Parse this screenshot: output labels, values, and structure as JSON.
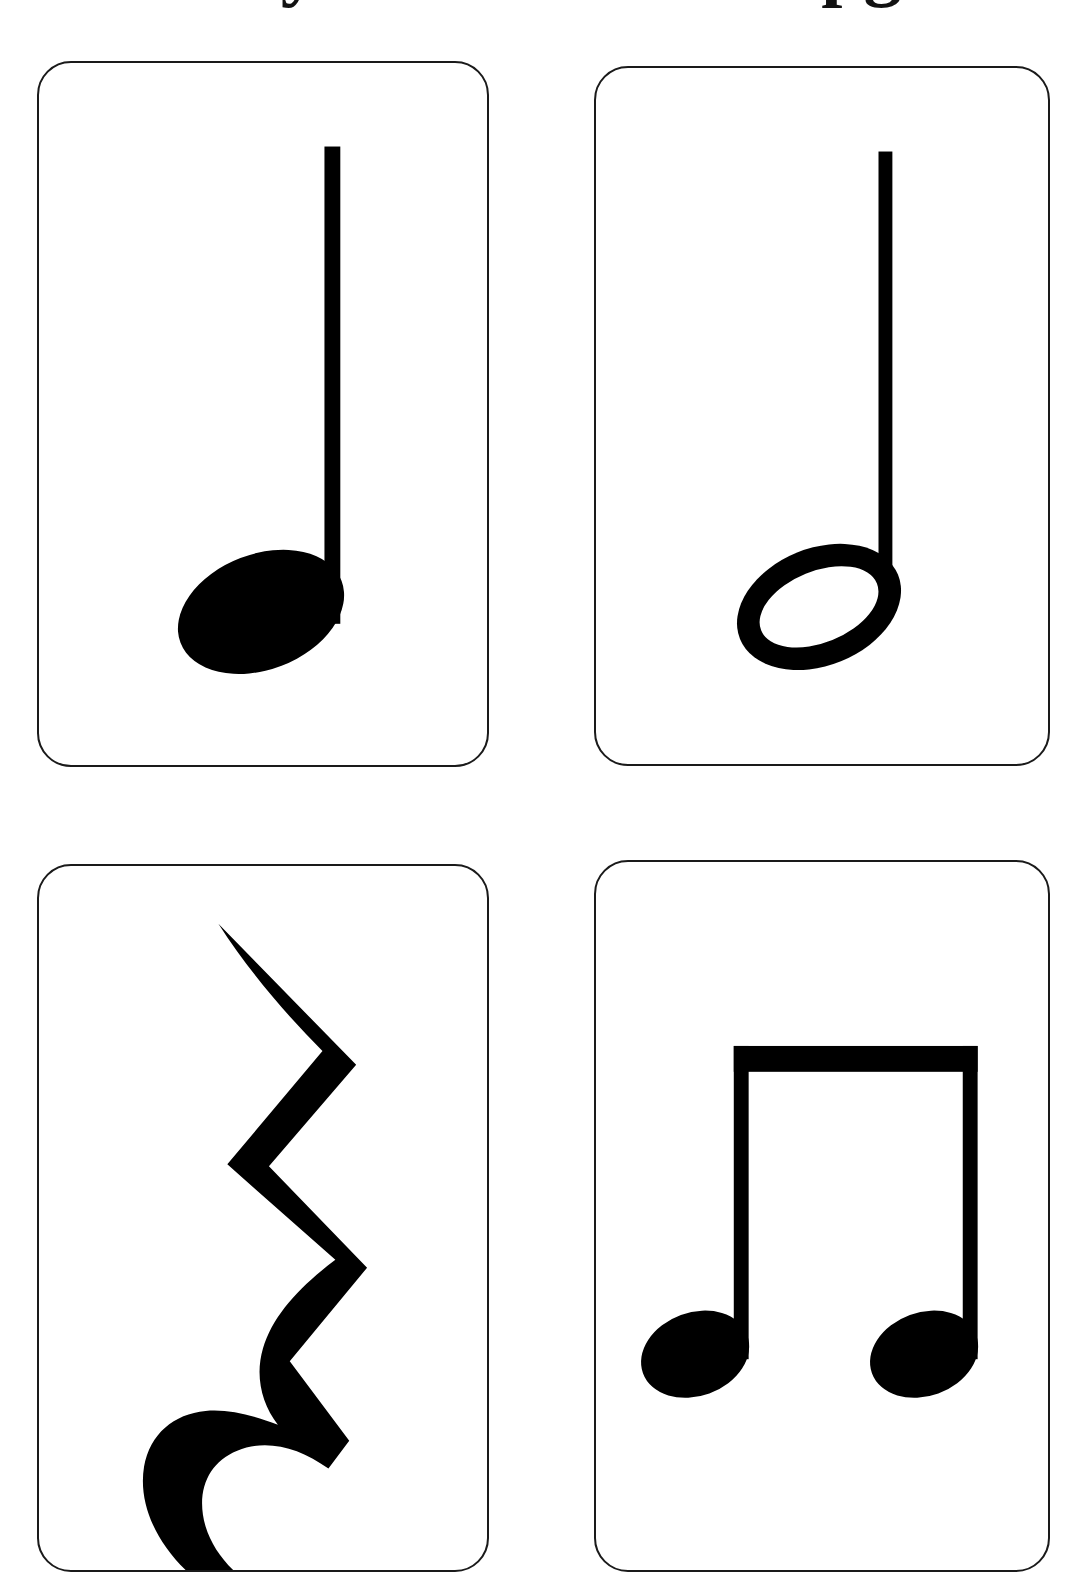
{
  "page": {
    "title_partial": "Rhythm flashcards pg",
    "background_color": "#ffffff",
    "ink_color": "#000000",
    "card_border_color": "#1a1a1a",
    "width": 1085,
    "height": 1583
  },
  "cards": [
    {
      "id": "card-1",
      "position": "top-left",
      "symbol_name": "quarter-note",
      "symbol_label": "Quarter Note",
      "notehead": "filled",
      "stem": "up",
      "beams": 0,
      "beats": "1"
    },
    {
      "id": "card-2",
      "position": "top-right",
      "symbol_name": "half-note",
      "symbol_label": "Half Note",
      "notehead": "hollow",
      "stem": "up",
      "beams": 0,
      "beats": "2"
    },
    {
      "id": "card-3",
      "position": "bottom-left",
      "symbol_name": "quarter-rest",
      "symbol_label": "Quarter Rest",
      "notehead": "none",
      "stem": "none",
      "beams": 0,
      "beats": "1"
    },
    {
      "id": "card-4",
      "position": "bottom-right",
      "symbol_name": "beamed-eighth-notes",
      "symbol_label": "Two Beamed Eighth Notes",
      "notehead": "filled",
      "stem": "up",
      "beams": 1,
      "beats": "1"
    }
  ]
}
